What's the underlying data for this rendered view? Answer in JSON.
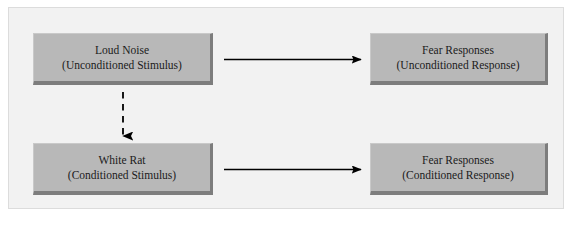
{
  "diagram": {
    "background_color": "#ffffff",
    "frame_color": "#f2f2f2",
    "box_fill_color": "#b8b8b8",
    "box_shadow_color": "#7d7d7d",
    "arrow_color": "#000000",
    "nodes": [
      {
        "id": "unconditioned-stimulus",
        "line1": "Loud Noise",
        "line2": "(Unconditioned Stimulus)"
      },
      {
        "id": "unconditioned-response",
        "line1": "Fear Responses",
        "line2": "(Unconditioned Response)"
      },
      {
        "id": "conditioned-stimulus",
        "line1": "White Rat",
        "line2": "(Conditioned Stimulus)"
      },
      {
        "id": "conditioned-response",
        "line1": "Fear Responses",
        "line2": "(Conditioned Response)"
      }
    ],
    "connectors": [
      {
        "id": "us-to-ur",
        "style": "solid",
        "direction": "right",
        "from": "unconditioned-stimulus",
        "to": "unconditioned-response"
      },
      {
        "id": "us-to-cs",
        "style": "dashed",
        "direction": "down",
        "from": "unconditioned-stimulus",
        "to": "conditioned-stimulus"
      },
      {
        "id": "cs-to-cr",
        "style": "solid",
        "direction": "right",
        "from": "conditioned-stimulus",
        "to": "conditioned-response"
      }
    ]
  }
}
